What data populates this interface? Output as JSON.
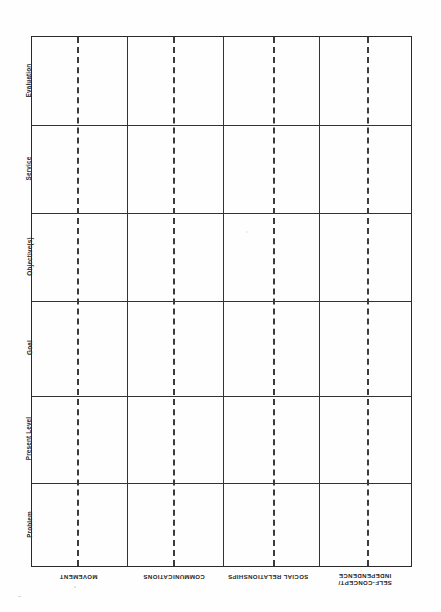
{
  "document": {
    "title": "Individualized Education Program Planning Matrix",
    "type": "blank-planning-grid"
  },
  "matrix": {
    "geometry": {
      "left": 31,
      "top": 36,
      "width": 381,
      "height": 531,
      "row_boundaries": [
        0,
        88,
        176,
        264,
        359,
        446,
        531
      ],
      "column_boundaries": [
        0,
        95,
        191,
        287,
        381
      ],
      "dashed_offsets": [
        45,
        141,
        241,
        335
      ]
    },
    "row_labels": [
      {
        "id": "evaluation",
        "label": "Evaluation"
      },
      {
        "id": "service",
        "label": "Service"
      },
      {
        "id": "objectives",
        "label": "Objective(s)"
      },
      {
        "id": "goal",
        "label": "Goal"
      },
      {
        "id": "present-level",
        "label": "Present Level"
      },
      {
        "id": "problem",
        "label": "Problem"
      }
    ],
    "column_labels": [
      {
        "id": "movement",
        "lines": [
          "MOVEMENT"
        ]
      },
      {
        "id": "communications",
        "lines": [
          "COMMUNICATIONS"
        ]
      },
      {
        "id": "social-relationships",
        "lines": [
          "SOCIAL RELATIONSHIPS"
        ]
      },
      {
        "id": "self-concept-independence",
        "lines": [
          "SELF-CONCEPT/",
          "INDEPENDENCE"
        ]
      }
    ],
    "cell_value": ""
  },
  "colors": {
    "page_background": "#fefefe",
    "border": "#2a2a2a",
    "separator": "#333333",
    "dashed_separator": "#3b3b3b",
    "text": "#262626"
  }
}
